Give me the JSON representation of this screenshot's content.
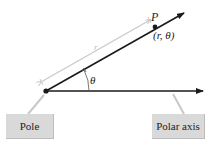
{
  "diagram": {
    "point_label": "P",
    "coord_label": "(r, θ)",
    "radius_label": "r",
    "angle_label": "θ",
    "pole_label": "Pole",
    "axis_label": "Polar axis"
  },
  "colors": {
    "line": "#1a1a1a",
    "dimension": "#c8c8c8",
    "box_fill": "#d9d9d9",
    "background": "#ffffff"
  }
}
